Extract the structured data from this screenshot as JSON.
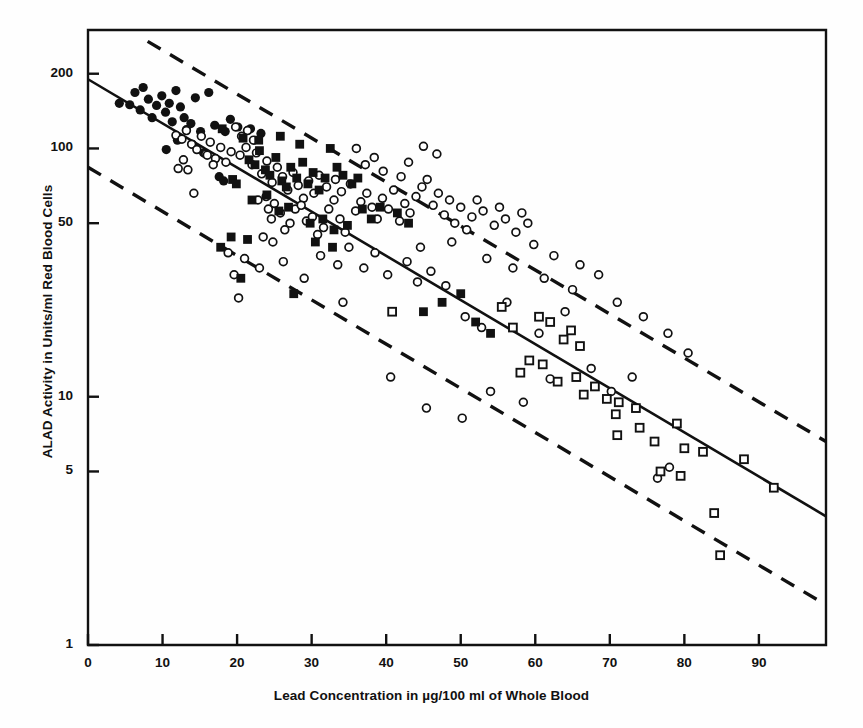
{
  "figure": {
    "background": "#ffffff",
    "ink": "#111111"
  },
  "chart_data": {
    "type": "scatter",
    "title": "",
    "xlabel": "Lead Concentration in µg/100 ml of Whole Blood",
    "ylabel": "ALAD Activity in Units/ml Red Blood Cells",
    "xscale": "linear",
    "yscale": "log",
    "xlim": [
      0,
      99
    ],
    "ylim": [
      1,
      300
    ],
    "grid": false,
    "legend": "none",
    "xticks": [
      0,
      10,
      20,
      30,
      40,
      50,
      60,
      70,
      80,
      90
    ],
    "xticklabels": [
      "0",
      "10",
      "20",
      "30",
      "40",
      "50",
      "60",
      "70",
      "80",
      "90"
    ],
    "yticks": [
      1,
      5,
      10,
      50,
      100,
      200
    ],
    "yticklabels": [
      "1",
      "5",
      "10",
      "50",
      "100",
      "200"
    ],
    "annotations": [],
    "lines": [
      {
        "name": "regression-line",
        "style": "solid",
        "x": [
          0,
          99
        ],
        "y": [
          190,
          3.3
        ]
      },
      {
        "name": "upper-confidence-band",
        "style": "dashed",
        "x": [
          8,
          99
        ],
        "y": [
          270,
          6.6
        ]
      },
      {
        "name": "lower-confidence-band",
        "style": "dashed",
        "x": [
          0,
          99
        ],
        "y": [
          84,
          1.45
        ]
      }
    ],
    "series": [
      {
        "name": "filled-circle-group",
        "marker": "filled-circle",
        "points": [
          [
            4.2,
            152
          ],
          [
            5.6,
            150
          ],
          [
            6.3,
            168
          ],
          [
            7.0,
            143
          ],
          [
            7.4,
            176
          ],
          [
            8.1,
            158
          ],
          [
            8.6,
            133
          ],
          [
            9.2,
            149
          ],
          [
            9.9,
            163
          ],
          [
            10.4,
            140
          ],
          [
            10.9,
            152
          ],
          [
            11.3,
            128
          ],
          [
            11.8,
            171
          ],
          [
            12.4,
            147
          ],
          [
            12.9,
            133
          ],
          [
            13.2,
            119
          ],
          [
            13.8,
            126
          ],
          [
            14.4,
            160
          ],
          [
            15.1,
            117
          ],
          [
            16.2,
            168
          ],
          [
            17.0,
            124
          ],
          [
            18.4,
            117
          ],
          [
            19.1,
            131
          ],
          [
            20.1,
            122
          ],
          [
            21.8,
            120
          ],
          [
            23.2,
            115
          ],
          [
            12.0,
            108
          ],
          [
            14.0,
            104
          ],
          [
            17.6,
            77
          ],
          [
            18.2,
            74
          ],
          [
            10.5,
            99
          ],
          [
            15.5,
            96
          ]
        ]
      },
      {
        "name": "open-circle-group",
        "marker": "open-circle",
        "points": [
          [
            11.8,
            113
          ],
          [
            12.6,
            109
          ],
          [
            13.2,
            118
          ],
          [
            13.9,
            104
          ],
          [
            14.6,
            99
          ],
          [
            15.2,
            112
          ],
          [
            15.8,
            95
          ],
          [
            16.4,
            106
          ],
          [
            17.1,
            91
          ],
          [
            17.8,
            101
          ],
          [
            18.5,
            88
          ],
          [
            19.2,
            97
          ],
          [
            12.1,
            83
          ],
          [
            13.4,
            82
          ],
          [
            16.8,
            86
          ],
          [
            14.2,
            66
          ],
          [
            20.4,
            94
          ],
          [
            21.2,
            101
          ],
          [
            22.0,
            86
          ],
          [
            22.6,
            96
          ],
          [
            23.3,
            79
          ],
          [
            24.0,
            89
          ],
          [
            24.7,
            73
          ],
          [
            25.4,
            84
          ],
          [
            19.8,
            122
          ],
          [
            20.6,
            112
          ],
          [
            21.4,
            118
          ],
          [
            22.2,
            108
          ],
          [
            26.1,
            77
          ],
          [
            26.8,
            68
          ],
          [
            27.5,
            80
          ],
          [
            28.2,
            71
          ],
          [
            28.9,
            63
          ],
          [
            29.6,
            74
          ],
          [
            30.3,
            66
          ],
          [
            31.0,
            78
          ],
          [
            24.2,
            57
          ],
          [
            25.0,
            60
          ],
          [
            24.6,
            52
          ],
          [
            25.8,
            55
          ],
          [
            26.4,
            47
          ],
          [
            27.1,
            50
          ],
          [
            23.5,
            44
          ],
          [
            24.8,
            42
          ],
          [
            22.8,
            62
          ],
          [
            23.9,
            64
          ],
          [
            27.8,
            57
          ],
          [
            28.6,
            59
          ],
          [
            29.3,
            51
          ],
          [
            30.1,
            53
          ],
          [
            30.8,
            45
          ],
          [
            31.6,
            48
          ],
          [
            32.3,
            57
          ],
          [
            33.0,
            62
          ],
          [
            33.8,
            52
          ],
          [
            34.5,
            46
          ],
          [
            32.0,
            70
          ],
          [
            33.2,
            75
          ],
          [
            34.0,
            67
          ],
          [
            35.2,
            72
          ],
          [
            35.9,
            56
          ],
          [
            36.6,
            61
          ],
          [
            37.4,
            66
          ],
          [
            38.1,
            58
          ],
          [
            38.8,
            52
          ],
          [
            39.5,
            63
          ],
          [
            40.3,
            57
          ],
          [
            41.0,
            68
          ],
          [
            41.8,
            51
          ],
          [
            42.5,
            60
          ],
          [
            43.2,
            55
          ],
          [
            44.0,
            64
          ],
          [
            36.0,
            100
          ],
          [
            37.2,
            86
          ],
          [
            38.4,
            92
          ],
          [
            39.6,
            81
          ],
          [
            42.0,
            77
          ],
          [
            43.0,
            88
          ],
          [
            44.8,
            70
          ],
          [
            45.5,
            75
          ],
          [
            46.3,
            59
          ],
          [
            47.0,
            66
          ],
          [
            47.8,
            54
          ],
          [
            48.5,
            62
          ],
          [
            49.2,
            50
          ],
          [
            50.0,
            58
          ],
          [
            50.8,
            47
          ],
          [
            51.5,
            53
          ],
          [
            45.0,
            102
          ],
          [
            46.8,
            95
          ],
          [
            52.2,
            62
          ],
          [
            53.0,
            56
          ],
          [
            54.5,
            49
          ],
          [
            55.2,
            58
          ],
          [
            56.0,
            52
          ],
          [
            57.4,
            46
          ],
          [
            58.2,
            55
          ],
          [
            59.0,
            50
          ],
          [
            31.2,
            37
          ],
          [
            33.5,
            34
          ],
          [
            35.0,
            40
          ],
          [
            37.0,
            33
          ],
          [
            38.5,
            38
          ],
          [
            40.2,
            31
          ],
          [
            42.8,
            35
          ],
          [
            44.2,
            29
          ],
          [
            46.0,
            32
          ],
          [
            48.0,
            28
          ],
          [
            29.0,
            30
          ],
          [
            26.2,
            35
          ],
          [
            23.0,
            33
          ],
          [
            21.0,
            36
          ],
          [
            18.8,
            38
          ],
          [
            19.6,
            31
          ],
          [
            40.6,
            12
          ],
          [
            45.4,
            9.0
          ],
          [
            50.2,
            8.2
          ],
          [
            54.0,
            10.5
          ],
          [
            58.4,
            9.5
          ],
          [
            62.0,
            11.8
          ],
          [
            50.6,
            21
          ],
          [
            52.8,
            19
          ],
          [
            56.2,
            24
          ],
          [
            60.5,
            18
          ],
          [
            64.0,
            22
          ],
          [
            67.5,
            13
          ],
          [
            70.2,
            10.5
          ],
          [
            73.0,
            12
          ],
          [
            76.4,
            4.7
          ],
          [
            78.0,
            5.2
          ],
          [
            20.2,
            25
          ],
          [
            34.2,
            24
          ],
          [
            12.8,
            90
          ],
          [
            16.0,
            94
          ],
          [
            44.6,
            40
          ],
          [
            48.8,
            42
          ],
          [
            53.5,
            36
          ],
          [
            57.0,
            33
          ],
          [
            61.2,
            30
          ],
          [
            65.0,
            27
          ],
          [
            59.8,
            41
          ],
          [
            62.5,
            37
          ],
          [
            66.0,
            34
          ],
          [
            68.5,
            31
          ],
          [
            71.0,
            24
          ],
          [
            74.5,
            21
          ],
          [
            77.8,
            18
          ],
          [
            80.5,
            15
          ]
        ]
      },
      {
        "name": "filled-square-group",
        "marker": "filled-square",
        "points": [
          [
            18.0,
            120
          ],
          [
            19.4,
            75
          ],
          [
            19.9,
            72
          ],
          [
            20.8,
            110
          ],
          [
            21.6,
            90
          ],
          [
            22.4,
            86
          ],
          [
            23.0,
            98
          ],
          [
            23.8,
            82
          ],
          [
            24.4,
            78
          ],
          [
            25.2,
            92
          ],
          [
            26.0,
            74
          ],
          [
            26.6,
            70
          ],
          [
            27.2,
            84
          ],
          [
            28.0,
            76
          ],
          [
            28.8,
            88
          ],
          [
            29.5,
            72
          ],
          [
            30.2,
            80
          ],
          [
            31.0,
            68
          ],
          [
            31.8,
            76
          ],
          [
            32.5,
            100
          ],
          [
            33.4,
            84
          ],
          [
            34.2,
            78
          ],
          [
            19.2,
            44
          ],
          [
            21.4,
            43
          ],
          [
            22.0,
            62
          ],
          [
            24.0,
            65
          ],
          [
            25.6,
            56
          ],
          [
            26.9,
            58
          ],
          [
            29.8,
            50
          ],
          [
            31.5,
            52
          ],
          [
            33.0,
            47
          ],
          [
            34.8,
            49
          ],
          [
            17.8,
            40
          ],
          [
            20.5,
            30
          ],
          [
            27.6,
            26
          ],
          [
            35.4,
            72
          ],
          [
            36.2,
            76
          ],
          [
            32.8,
            40
          ],
          [
            30.5,
            42
          ],
          [
            22.9,
            108
          ],
          [
            25.8,
            112
          ],
          [
            28.4,
            104
          ],
          [
            36.8,
            57
          ],
          [
            38.0,
            52
          ],
          [
            50.0,
            26
          ],
          [
            52.0,
            20
          ],
          [
            54.0,
            18
          ],
          [
            39.2,
            58
          ],
          [
            41.5,
            55
          ],
          [
            43.0,
            50
          ],
          [
            45.0,
            22
          ],
          [
            47.5,
            24
          ]
        ]
      },
      {
        "name": "open-square-group",
        "marker": "open-square",
        "points": [
          [
            40.8,
            22
          ],
          [
            57.0,
            19
          ],
          [
            60.5,
            21
          ],
          [
            62.0,
            20
          ],
          [
            63.8,
            17
          ],
          [
            64.8,
            18.5
          ],
          [
            66.0,
            16
          ],
          [
            59.2,
            14
          ],
          [
            61.0,
            13.5
          ],
          [
            65.5,
            12
          ],
          [
            68.0,
            11
          ],
          [
            69.6,
            9.8
          ],
          [
            71.2,
            9.5
          ],
          [
            71.0,
            7.0
          ],
          [
            70.8,
            8.5
          ],
          [
            74.0,
            7.5
          ],
          [
            76.0,
            6.6
          ],
          [
            76.8,
            5.0
          ],
          [
            79.5,
            4.8
          ],
          [
            80.0,
            6.2
          ],
          [
            82.5,
            6.0
          ],
          [
            84.0,
            3.4
          ],
          [
            84.8,
            2.3
          ],
          [
            88.0,
            5.6
          ],
          [
            92.0,
            4.3
          ],
          [
            63.0,
            11.5
          ],
          [
            66.5,
            10.2
          ],
          [
            55.5,
            23
          ],
          [
            58.0,
            12.5
          ],
          [
            73.5,
            9.0
          ],
          [
            79.0,
            7.8
          ]
        ]
      }
    ]
  }
}
